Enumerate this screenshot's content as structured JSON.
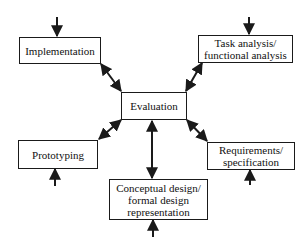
{
  "diagram": {
    "type": "iterative design lifecycle",
    "center": {
      "id": "evaluation",
      "lines": [
        "Evaluation"
      ]
    },
    "nodes": [
      {
        "id": "implementation",
        "lines": [
          "Implementation"
        ]
      },
      {
        "id": "task-analysis",
        "lines": [
          "Task analysis/",
          "functional analysis"
        ]
      },
      {
        "id": "prototyping",
        "lines": [
          "Prototyping"
        ]
      },
      {
        "id": "requirements",
        "lines": [
          "Requirements/",
          "specification"
        ]
      },
      {
        "id": "conceptual-design",
        "lines": [
          "Conceptual design/",
          "formal design",
          "representation"
        ]
      }
    ],
    "edges": [
      {
        "from": "evaluation",
        "to": "implementation",
        "bidirectional": true
      },
      {
        "from": "evaluation",
        "to": "task-analysis",
        "bidirectional": true
      },
      {
        "from": "evaluation",
        "to": "prototyping",
        "bidirectional": true
      },
      {
        "from": "evaluation",
        "to": "requirements",
        "bidirectional": true
      },
      {
        "from": "evaluation",
        "to": "conceptual-design",
        "bidirectional": true
      }
    ],
    "entry_arrows": [
      {
        "target": "implementation",
        "direction": "down-from-above"
      },
      {
        "target": "task-analysis",
        "direction": "down-from-above"
      },
      {
        "target": "prototyping",
        "direction": "up-from-below"
      },
      {
        "target": "requirements",
        "direction": "up-from-below"
      },
      {
        "target": "conceptual-design",
        "direction": "up-from-below"
      }
    ],
    "colors": {
      "line": "#1a1a1a",
      "background": "#ffffff"
    }
  }
}
